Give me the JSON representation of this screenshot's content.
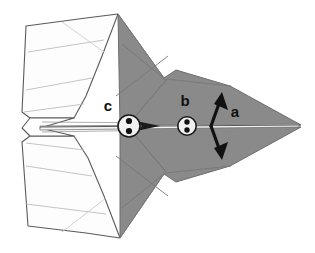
{
  "figure": {
    "background_color": "#ffffff"
  },
  "colors": {
    "body_gray": "#8a8a8a",
    "body_gray_dark": "#7c7c7c",
    "body_gray_light": "#9a9a9a",
    "wing_white": "#fdfdfd",
    "outline": "#555555",
    "fold_line": "#b4b4b4",
    "ink_black": "#111111",
    "spine_highlight": "#f2f2f2"
  },
  "labels": [
    {
      "id": "label-c",
      "text": "c",
      "x": 112,
      "y": 111,
      "describes": "rear circular marker on spine"
    },
    {
      "id": "label-b",
      "text": "b",
      "x": 188,
      "y": 106,
      "describes": "forward circular marker on spine"
    },
    {
      "id": "label-a",
      "text": "a",
      "x": 232,
      "y": 117,
      "describes": "vertical double headed dimension arrow"
    }
  ],
  "markers": [
    {
      "id": "marker-c",
      "label": "c",
      "cx": 129,
      "cy": 126,
      "r": 11,
      "dot_count": 2,
      "dot_layout": "vertical-pair"
    },
    {
      "id": "marker-b",
      "label": "b",
      "cx": 187,
      "cy": 126,
      "r": 9,
      "dot_count": 2,
      "dot_layout": "vertical-pair"
    }
  ],
  "annotations": {
    "dimension_arrow": {
      "id": "arrow-a",
      "label": "a",
      "orientation": "vertical",
      "heads": "double",
      "x": 215,
      "y_top": 95,
      "y_bottom": 157
    },
    "spine_arrow": {
      "id": "spine-arrow",
      "orientation": "horizontal",
      "heads": "single-right",
      "x_start": 136,
      "x_end": 158,
      "y": 126
    }
  },
  "geometry": {
    "nose_tip": {
      "x": 301,
      "y": 125
    },
    "tail_notch": {
      "x": 22,
      "y": 128
    },
    "spine_y": 126,
    "body_fill": "gray",
    "wing_fill": "white"
  }
}
